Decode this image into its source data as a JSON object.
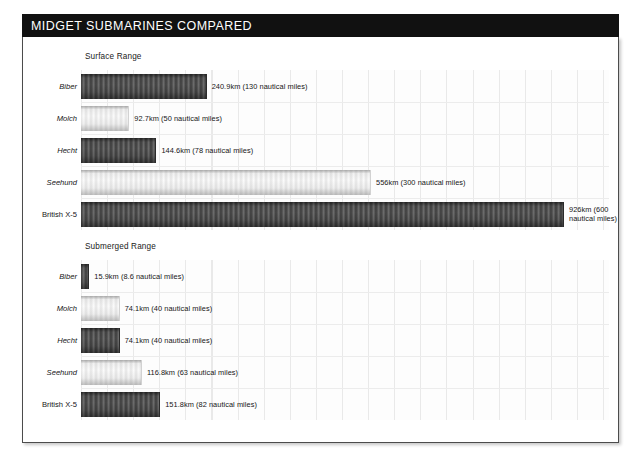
{
  "header": {
    "title": "MIDGET SUBMARINES COMPARED"
  },
  "chart_data": {
    "type": "bar",
    "title": "MIDGET SUBMARINES COMPARED",
    "orientation": "horizontal",
    "xlabel": "",
    "ylabel": "",
    "unit": "km",
    "xlim": [
      0,
      1010
    ],
    "grid": true,
    "grid_interval_km": 50,
    "legend": "none",
    "categories": [
      "Biber",
      "Molch",
      "Hecht",
      "Seehund",
      "British X-5"
    ],
    "panels": [
      {
        "id": "surface",
        "heading": "Surface Range",
        "values": [
          240.9,
          92.7,
          144.6,
          556,
          926
        ],
        "nautical_miles": [
          130,
          50,
          78,
          300,
          600
        ],
        "bars": [
          {
            "label": "Biber",
            "label_style": "italic",
            "km": 240.9,
            "nm": 130,
            "value_text": "240.9km (130 nautical miles)",
            "shade": "dark"
          },
          {
            "label": "Molch",
            "label_style": "italic",
            "km": 92.7,
            "nm": 50,
            "value_text": "92.7km (50 nautical miles)",
            "shade": "light"
          },
          {
            "label": "Hecht",
            "label_style": "italic",
            "km": 144.6,
            "nm": 78,
            "value_text": "144.6km (78 nautical miles)",
            "shade": "dark"
          },
          {
            "label": "Seehund",
            "label_style": "italic",
            "km": 556,
            "nm": 300,
            "value_text": "556km (300 nautical miles)",
            "shade": "light"
          },
          {
            "label": "British X-5",
            "label_style": "normal",
            "km": 926,
            "nm": 600,
            "value_text": "926km (600 nautical miles)",
            "shade": "dark"
          }
        ]
      },
      {
        "id": "submerged",
        "heading": "Submerged Range",
        "values": [
          15.9,
          74.1,
          74.1,
          116.8,
          151.8
        ],
        "nautical_miles": [
          8.6,
          40,
          40,
          63,
          82
        ],
        "bars": [
          {
            "label": "Biber",
            "label_style": "italic",
            "km": 15.9,
            "nm": 8.6,
            "value_text": "15.9km (8.6 nautical miles)",
            "shade": "dark"
          },
          {
            "label": "Molch",
            "label_style": "italic",
            "km": 74.1,
            "nm": 40,
            "value_text": "74.1km (40 nautical miles)",
            "shade": "light"
          },
          {
            "label": "Hecht",
            "label_style": "italic",
            "km": 74.1,
            "nm": 40,
            "value_text": "74.1km (40 nautical miles)",
            "shade": "dark"
          },
          {
            "label": "Seehund",
            "label_style": "italic",
            "km": 116.8,
            "nm": 63,
            "value_text": "116.8km (63 nautical miles)",
            "shade": "light"
          },
          {
            "label": "British X-5",
            "label_style": "normal",
            "km": 151.8,
            "nm": 82,
            "value_text": "151.8km (82 nautical miles)",
            "shade": "dark"
          }
        ]
      }
    ]
  },
  "colors": {
    "title_bar_bg": "#111111",
    "title_text": "#ffffff",
    "bar_dark": "#4a4a4a",
    "bar_light": "#f0f0f0",
    "panel_border": "#4c4c4c",
    "gridline": "#e9e9e9",
    "text": "#161616"
  }
}
